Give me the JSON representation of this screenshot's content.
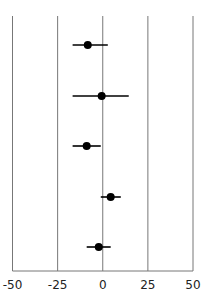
{
  "chart_data": {
    "type": "scatter",
    "subtype": "forest-plot",
    "title": "",
    "xlabel": "",
    "ylabel": "",
    "xlim": [
      -50,
      50
    ],
    "xticks": [
      -50,
      -25,
      0,
      25,
      50
    ],
    "xtick_labels": [
      "-50",
      "-25",
      "0",
      "25",
      "50"
    ],
    "grid": "vertical",
    "legend": "none",
    "series": [
      {
        "name": "estimates",
        "points": [
          {
            "row": 1,
            "estimate": -8.3,
            "ci_low": -16.7,
            "ci_high": 2.8
          },
          {
            "row": 2,
            "estimate": -0.6,
            "ci_low": -16.7,
            "ci_high": 14.4
          },
          {
            "row": 3,
            "estimate": -8.9,
            "ci_low": -16.7,
            "ci_high": -1.1
          },
          {
            "row": 4,
            "estimate": 4.4,
            "ci_low": -1.1,
            "ci_high": 10.0
          },
          {
            "row": 5,
            "estimate": -2.2,
            "ci_low": -8.9,
            "ci_high": 4.4
          }
        ]
      }
    ],
    "colors": {
      "grid": "#777777",
      "point": "#000000"
    }
  }
}
